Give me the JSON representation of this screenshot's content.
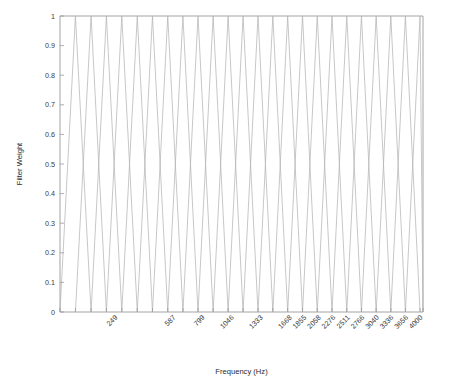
{
  "chart_data": {
    "type": "line",
    "title": "",
    "xlabel": "Frequency (Hz)",
    "ylabel": "Filter Weight",
    "xlim": [
      0,
      4000
    ],
    "ylim": [
      0,
      1
    ],
    "grid": false,
    "legend": false,
    "legend_position": "none",
    "line_color": "#b4b4b4",
    "axis_color": "#9a9a9a",
    "background": "#ffffff",
    "y_ticks": [
      0,
      0.1,
      0.2,
      0.3,
      0.4,
      0.5,
      0.6,
      0.7,
      0.8,
      0.9,
      1
    ],
    "y_tick_labels": [
      "0",
      "0.1",
      "0.2",
      "0.3",
      "0.4",
      "0.5",
      "0.6",
      "0.7",
      "0.8",
      "0.9",
      "1"
    ],
    "x_tick_values": [
      0,
      59,
      124,
      193,
      268,
      350,
      437,
      532,
      634,
      744,
      863,
      991,
      1129,
      1278,
      1438,
      1611,
      1798,
      1999,
      2216,
      2451,
      2703,
      2976,
      3270,
      3586,
      3928,
      4000
    ],
    "x_tick_labeled": [
      {
        "value": 249,
        "label": "249"
      },
      {
        "value": 587,
        "label": "587"
      },
      {
        "value": 799,
        "label": "799"
      },
      {
        "value": 1046,
        "label": "1046"
      },
      {
        "value": 1333,
        "label": "1333"
      },
      {
        "value": 1668,
        "label": "1668"
      },
      {
        "value": 1855,
        "label": "1855"
      },
      {
        "value": 2058,
        "label": "2058"
      },
      {
        "value": 2276,
        "label": "2276"
      },
      {
        "value": 2511,
        "label": "2511"
      },
      {
        "value": 2766,
        "label": "2766"
      },
      {
        "value": 3040,
        "label": "3040"
      },
      {
        "value": 3336,
        "label": "3336"
      },
      {
        "value": 3656,
        "label": "3656"
      },
      {
        "value": 4000,
        "label": "4000"
      }
    ],
    "x_tick_label_rotation": -45,
    "series": [
      {
        "name": "filterbank",
        "peak_value": 1,
        "filters": [
          {
            "index": 1,
            "left": 0,
            "center": 59,
            "right": 124
          },
          {
            "index": 2,
            "left": 59,
            "center": 124,
            "right": 193
          },
          {
            "index": 3,
            "left": 124,
            "center": 193,
            "right": 268
          },
          {
            "index": 4,
            "left": 193,
            "center": 268,
            "right": 350
          },
          {
            "index": 5,
            "left": 268,
            "center": 350,
            "right": 437
          },
          {
            "index": 6,
            "left": 350,
            "center": 437,
            "right": 532
          },
          {
            "index": 7,
            "left": 437,
            "center": 532,
            "right": 634
          },
          {
            "index": 8,
            "left": 532,
            "center": 634,
            "right": 744
          },
          {
            "index": 9,
            "left": 634,
            "center": 744,
            "right": 863
          },
          {
            "index": 10,
            "left": 744,
            "center": 863,
            "right": 991
          },
          {
            "index": 11,
            "left": 863,
            "center": 991,
            "right": 1129
          },
          {
            "index": 12,
            "left": 991,
            "center": 1129,
            "right": 1278
          },
          {
            "index": 13,
            "left": 1129,
            "center": 1278,
            "right": 1438
          },
          {
            "index": 14,
            "left": 1278,
            "center": 1438,
            "right": 1611
          },
          {
            "index": 15,
            "left": 1438,
            "center": 1611,
            "right": 1798
          },
          {
            "index": 16,
            "left": 1611,
            "center": 1798,
            "right": 1999
          },
          {
            "index": 17,
            "left": 1798,
            "center": 1999,
            "right": 2216
          },
          {
            "index": 18,
            "left": 1999,
            "center": 2216,
            "right": 2451
          },
          {
            "index": 19,
            "left": 2216,
            "center": 2451,
            "right": 2703
          },
          {
            "index": 20,
            "left": 2451,
            "center": 2703,
            "right": 2976
          },
          {
            "index": 21,
            "left": 2703,
            "center": 2976,
            "right": 3270
          },
          {
            "index": 22,
            "left": 2976,
            "center": 3270,
            "right": 3586
          },
          {
            "index": 23,
            "left": 3270,
            "center": 3586,
            "right": 3928
          },
          {
            "index": 24,
            "left": 3586,
            "center": 3928,
            "right": 4000
          }
        ]
      }
    ]
  }
}
